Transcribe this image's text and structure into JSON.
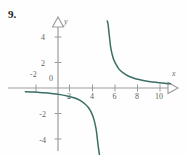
{
  "figure": {
    "problem_number": "9.",
    "axis_color": "#9b9b9b",
    "curve_color": "#3c6e66",
    "tick_label_color": "#5f5f5f",
    "background": "#fefefe"
  },
  "chart_data": {
    "type": "line",
    "title": "",
    "subtitle": "",
    "xlabel": "x",
    "ylabel": "y",
    "xlim": [
      -3,
      11
    ],
    "ylim": [
      -5.6,
      5.6
    ],
    "xticks": [
      -2,
      0,
      2,
      4,
      6,
      8,
      10
    ],
    "yticks": [
      -4,
      -2,
      0,
      2,
      4
    ],
    "xtick_labels": [
      "-2",
      "0",
      "2",
      "4",
      "6",
      "8",
      "10"
    ],
    "ytick_labels": [
      "-4",
      "-2",
      "0",
      "2",
      "4"
    ],
    "grid": false,
    "legend": "none",
    "asymptotes": {
      "vertical_x": 4,
      "horizontal_y": 0
    },
    "annotations": [],
    "series": [
      {
        "name": "upper-right-branch",
        "comment": "y = 2/(x-4) branch for x > 4, falls from +5 near x=4.4 toward y=0 at x=10",
        "x": [
          4.38,
          4.45,
          4.55,
          4.7,
          4.9,
          5.1,
          5.4,
          5.8,
          6.2,
          6.7,
          7.2,
          7.8,
          8.4,
          9.0,
          9.6,
          10.0
        ],
        "y": [
          5.26,
          5.0,
          4.2,
          3.1,
          2.35,
          1.95,
          1.5,
          1.18,
          0.96,
          0.79,
          0.66,
          0.55,
          0.47,
          0.41,
          0.36,
          0.33
        ]
      },
      {
        "name": "lower-left-branch",
        "comment": "y = 2/(x-4) branch for x < 4, rises from -infinity near x=3.9 toward y=0 as x decreases",
        "x": [
          -2.9,
          -2.2,
          -1.4,
          -0.6,
          0.2,
          0.9,
          1.5,
          2.0,
          2.4,
          2.7,
          3.0,
          3.2,
          3.4,
          3.55,
          3.68,
          3.78,
          3.86,
          3.9
        ],
        "y": [
          -0.29,
          -0.32,
          -0.37,
          -0.43,
          -0.52,
          -0.64,
          -0.79,
          -0.99,
          -1.25,
          -1.53,
          -1.99,
          -2.48,
          -3.3,
          -4.4,
          -5.2,
          -5.5,
          -5.6,
          -5.6
        ]
      }
    ]
  }
}
